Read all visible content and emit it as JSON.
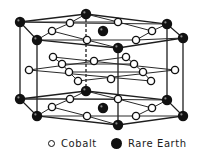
{
  "figure": {
    "title": "",
    "colors": {
      "cobalt_fill": "#ffffff",
      "cobalt_stroke": "#111111",
      "rare_earth_fill": "#111111",
      "line": "#222222"
    }
  },
  "legend": {
    "items": [
      {
        "label": "Cobalt",
        "symbol": "open-circle"
      },
      {
        "label": "Rare Earth",
        "symbol": "filled-circle"
      }
    ]
  },
  "atoms": {
    "rare_earth": [
      [
        20,
        22
      ],
      [
        86,
        14
      ],
      [
        167,
        24
      ],
      [
        183,
        38
      ],
      [
        118,
        48
      ],
      [
        37,
        40
      ],
      [
        103,
        31
      ],
      [
        86,
        91
      ],
      [
        20,
        99
      ],
      [
        37,
        116
      ],
      [
        118,
        125
      ],
      [
        183,
        116
      ],
      [
        167,
        100
      ],
      [
        103,
        108
      ]
    ],
    "cobalt": [
      [
        70,
        23
      ],
      [
        52,
        31
      ],
      [
        87,
        40
      ],
      [
        118,
        22
      ],
      [
        152,
        31
      ],
      [
        136,
        40
      ],
      [
        53,
        57
      ],
      [
        62,
        64
      ],
      [
        69,
        72
      ],
      [
        78,
        81
      ],
      [
        94,
        61
      ],
      [
        111,
        79
      ],
      [
        29,
        70
      ],
      [
        126,
        57
      ],
      [
        134,
        64
      ],
      [
        143,
        72
      ],
      [
        151,
        81
      ],
      [
        175,
        70
      ],
      [
        70,
        99
      ],
      [
        52,
        107
      ],
      [
        87,
        116
      ],
      [
        118,
        99
      ],
      [
        152,
        108
      ],
      [
        136,
        116
      ]
    ]
  }
}
